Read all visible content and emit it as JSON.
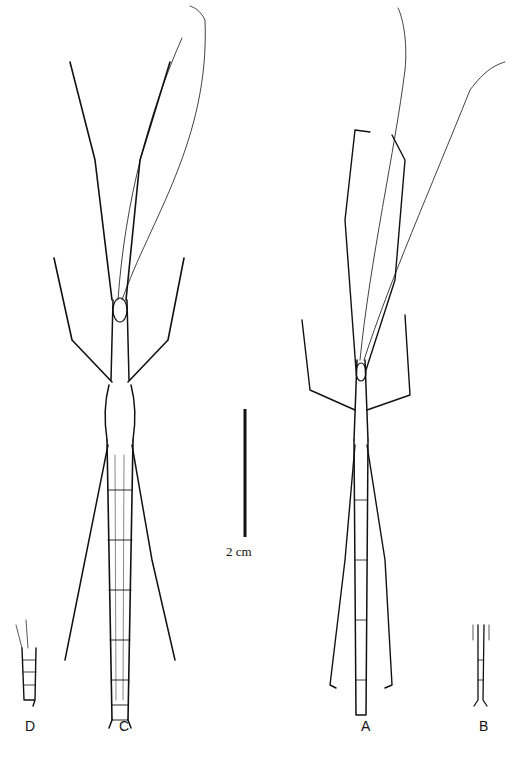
{
  "figure": {
    "scale_bar": {
      "label": "2 cm"
    },
    "specimens": [
      {
        "id": "D",
        "label": "D",
        "description": "abdomen tip detail"
      },
      {
        "id": "C",
        "label": "C",
        "description": "stick insect dorsal view (female)"
      },
      {
        "id": "A",
        "label": "A",
        "description": "stick insect dorsal view (male)"
      },
      {
        "id": "B",
        "label": "B",
        "description": "abdomen tip detail"
      }
    ]
  }
}
